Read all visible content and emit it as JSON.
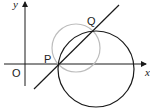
{
  "diagram": {
    "labels": {
      "y_axis": "y",
      "x_axis": "x",
      "origin": "O",
      "point_p": "P",
      "point_q": "Q"
    },
    "colors": {
      "stroke": "#1a1a1a",
      "secondary_circle": "#bdbdbd",
      "background": "#ffffff"
    },
    "elements": {
      "axes": {
        "origin_px": [
          25,
          64
        ]
      },
      "large_circle": {
        "center_px": [
          96,
          69
        ],
        "radius_px": 38
      },
      "small_circle": {
        "center_px": [
          76,
          48
        ],
        "radius_px": 24
      },
      "line": {
        "from_px": [
          34,
          89
        ],
        "to_px": [
          119,
          5
        ]
      },
      "point_p_px": [
        58,
        65
      ],
      "point_q_px": [
        92,
        31
      ]
    }
  }
}
